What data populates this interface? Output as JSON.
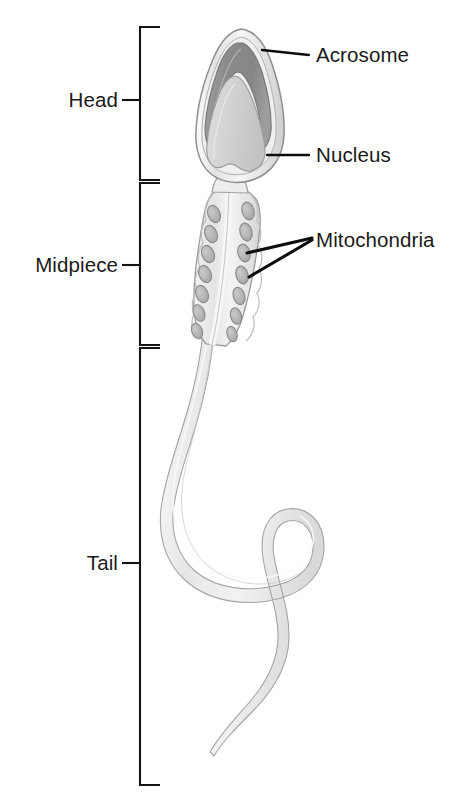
{
  "figure": {
    "background_color": "#ffffff"
  },
  "region_brackets": [
    {
      "id": "head",
      "label": "Head",
      "label_x": 120,
      "label_y": 107,
      "tick_y": 100,
      "bracket_top": 27,
      "bracket_bottom": 180
    },
    {
      "id": "midpiece",
      "label": "Midpiece",
      "label_x": 120,
      "label_y": 272,
      "tick_y": 265,
      "bracket_top": 183,
      "bracket_bottom": 345
    },
    {
      "id": "tail",
      "label": "Tail",
      "label_x": 120,
      "label_y": 570,
      "tick_y": 563,
      "bracket_top": 348,
      "bracket_bottom": 785
    }
  ],
  "bracket_geometry": {
    "spine_x": 140,
    "arm_length": 20,
    "tick_length": 18,
    "tick_gap": 4
  },
  "callouts": [
    {
      "id": "acrosome",
      "label": "Acrosome",
      "label_x": 316,
      "label_y": 62,
      "line_start_x": 262,
      "line_start_y": 50,
      "line_end_x": 309,
      "line_end_y": 55
    },
    {
      "id": "nucleus",
      "label": "Nucleus",
      "label_x": 316,
      "label_y": 162,
      "line_start_x": 267,
      "line_start_y": 155,
      "line_end_x": 309,
      "line_end_y": 155
    },
    {
      "id": "mitochondria",
      "label": "Mitochondria",
      "label_x": 316,
      "label_y": 247,
      "leaders": [
        {
          "start_x": 247,
          "start_y": 253,
          "end_x": 312,
          "end_y": 238
        },
        {
          "start_x": 249,
          "start_y": 277,
          "end_x": 312,
          "end_y": 240
        }
      ]
    }
  ],
  "cell_parts": {
    "head": {
      "name": "head",
      "membrane_color": "#f0f0f0",
      "outline_color": "#8e8e8e"
    },
    "acrosome": {
      "name": "acrosome",
      "fill_color": "#8d8d8d",
      "inner_color": "#a5a5a5"
    },
    "nucleus": {
      "name": "nucleus",
      "fill_color": "#d2d2d2",
      "outline_color": "#9a9a9a"
    },
    "midpiece": {
      "name": "midpiece",
      "fill_color": "#ebebeb",
      "axoneme_color": "#dcdcdc"
    },
    "mitochondria": {
      "name": "mitochondria",
      "fill_color": "#b9b9b9",
      "outline_color": "#8a8a8a",
      "count_left": 7,
      "count_right": 7
    },
    "tail": {
      "name": "tail",
      "fill_color": "#e8e8e8",
      "outline_color": "#a8a8a8"
    }
  },
  "mitochondria_positions": {
    "left": [
      {
        "cx": 214,
        "cy": 214,
        "rx": 6.0,
        "ry": 9.0,
        "angle": -22
      },
      {
        "cx": 211,
        "cy": 234,
        "rx": 6.0,
        "ry": 9.0,
        "angle": -22
      },
      {
        "cx": 208,
        "cy": 254,
        "rx": 6.0,
        "ry": 9.0,
        "angle": -22
      },
      {
        "cx": 205,
        "cy": 274,
        "rx": 6.0,
        "ry": 9.0,
        "angle": -22
      },
      {
        "cx": 202,
        "cy": 294,
        "rx": 6.0,
        "ry": 9.0,
        "angle": -22
      },
      {
        "cx": 199,
        "cy": 313,
        "rx": 5.6,
        "ry": 8.6,
        "angle": -22
      },
      {
        "cx": 197,
        "cy": 331,
        "rx": 5.2,
        "ry": 8.0,
        "angle": -22
      }
    ],
    "right": [
      {
        "cx": 248,
        "cy": 211,
        "rx": 6.0,
        "ry": 9.0,
        "angle": -16
      },
      {
        "cx": 246,
        "cy": 232,
        "rx": 6.0,
        "ry": 9.0,
        "angle": -16
      },
      {
        "cx": 244,
        "cy": 253,
        "rx": 6.0,
        "ry": 9.0,
        "angle": -16
      },
      {
        "cx": 242,
        "cy": 275,
        "rx": 6.0,
        "ry": 9.0,
        "angle": -16
      },
      {
        "cx": 239,
        "cy": 296,
        "rx": 5.8,
        "ry": 8.8,
        "angle": -16
      },
      {
        "cx": 236,
        "cy": 316,
        "rx": 5.4,
        "ry": 8.4,
        "angle": -16
      },
      {
        "cx": 232,
        "cy": 334,
        "rx": 5.0,
        "ry": 7.8,
        "angle": -16
      }
    ]
  }
}
